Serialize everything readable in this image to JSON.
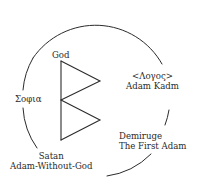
{
  "diagram": {
    "labels": {
      "god": "God",
      "sophia": "Σοφια",
      "logos": "<Λογος>",
      "adam_kadm": "Adam Kadm",
      "demiurge": "Demiruge",
      "first_adam": "The First Adam",
      "satan": "Satan",
      "adam_without_god": "Adam-Without-God"
    },
    "shapes": {
      "circle": {
        "cx": 96,
        "cy": 100,
        "r": 76,
        "stroke": "#2b2b2b"
      },
      "triangles": [
        {
          "name": "upper",
          "points": [
            [
              61,
              61
            ],
            [
              100,
              81
            ],
            [
              61,
              100
            ]
          ]
        },
        {
          "name": "lower",
          "points": [
            [
              61,
              100
            ],
            [
              100,
              120
            ],
            [
              61,
              140
            ]
          ]
        }
      ]
    }
  }
}
